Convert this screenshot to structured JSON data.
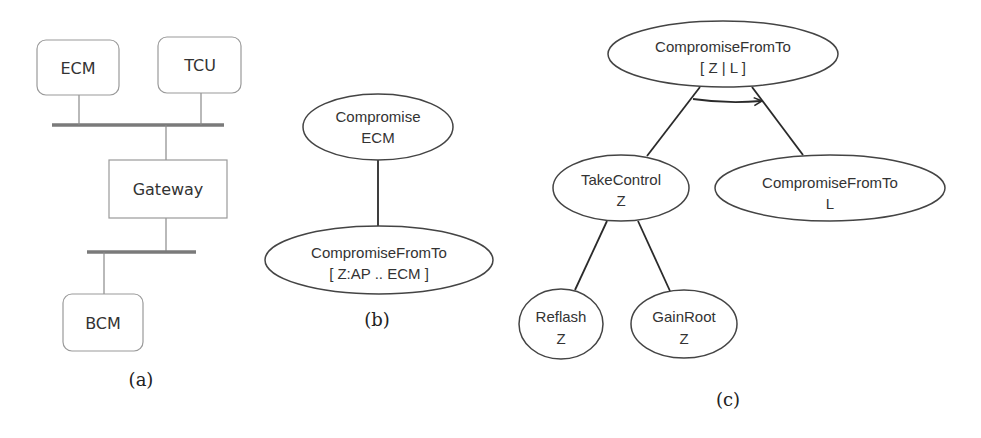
{
  "colors": {
    "background": "#ffffff",
    "box_stroke": "#9a9a9a",
    "bus": "#7a7a7a",
    "connector": "#8a8a8a",
    "ellipse_stroke": "#444444",
    "edge": "#2a2a2a",
    "text": "#333333"
  },
  "panel_a": {
    "caption": "(a)",
    "nodes": {
      "ecm": "ECM",
      "tcu": "TCU",
      "gateway": "Gateway",
      "bcm": "BCM"
    }
  },
  "panel_b": {
    "caption": "(b)",
    "nodes": [
      {
        "line1": "Compromise",
        "line2": "ECM"
      },
      {
        "line1": "CompromiseFromTo",
        "line2": "[ Z:AP .. ECM ]"
      }
    ]
  },
  "panel_c": {
    "caption": "(c)",
    "nodes": {
      "root": {
        "line1": "CompromiseFromTo",
        "line2": "[ Z | L ]"
      },
      "take_control": {
        "line1": "TakeControl",
        "line2": "Z"
      },
      "compromise_l": {
        "line1": "CompromiseFromTo",
        "line2": "L"
      },
      "reflash": {
        "line1": "Reflash",
        "line2": "Z"
      },
      "gain_root": {
        "line1": "GainRoot",
        "line2": "Z"
      }
    },
    "sequence_arrow": "ordered-AND"
  }
}
